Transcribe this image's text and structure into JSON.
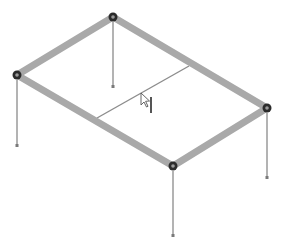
{
  "viewport": {
    "background": "#ffffff",
    "type": "3D structural frame view (isometric)"
  },
  "colors": {
    "beam": "#a9a9a9",
    "inner_beam": "#8c8c8c",
    "column": "#8a8a8a",
    "node_outer": "#2b2b2b",
    "node_inner": "#9a9a9a",
    "column_base": "#7a7a7a",
    "cursor": "#555555"
  },
  "nodes": [
    {
      "id": "top",
      "x": 113,
      "y": 17
    },
    {
      "id": "left",
      "x": 17,
      "y": 75
    },
    {
      "id": "right",
      "x": 267,
      "y": 108
    },
    {
      "id": "bottom",
      "x": 173,
      "y": 166
    }
  ],
  "beams": [
    {
      "from": "top",
      "to": "left"
    },
    {
      "from": "top",
      "to": "right"
    },
    {
      "from": "left",
      "to": "bottom"
    },
    {
      "from": "right",
      "to": "bottom"
    }
  ],
  "inner_beam": {
    "x1": 97,
    "y1": 118,
    "x2": 189,
    "y2": 66
  },
  "columns": [
    {
      "node": "top",
      "x": 113,
      "y_top": 22,
      "y_base": 86
    },
    {
      "node": "left",
      "x": 17,
      "y_top": 80,
      "y_base": 145
    },
    {
      "node": "right",
      "x": 267,
      "y_top": 113,
      "y_base": 177
    },
    {
      "node": "bottom",
      "x": 173,
      "y_top": 171,
      "y_base": 235
    }
  ],
  "cursor": {
    "x": 141,
    "y": 93,
    "icon": "pointer-with-beam-tool"
  }
}
